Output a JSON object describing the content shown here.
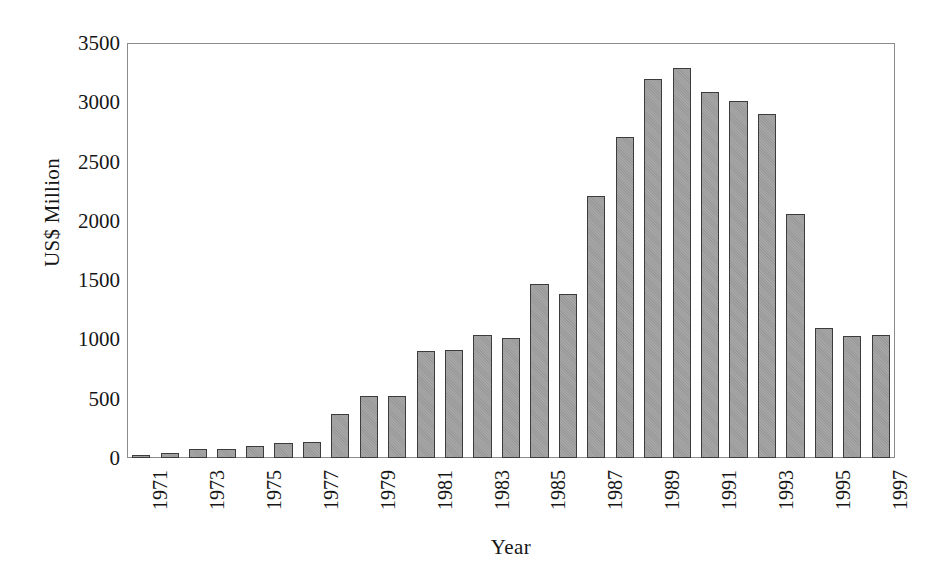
{
  "chart_data": {
    "type": "bar",
    "title": "",
    "xlabel": "Year",
    "ylabel": "US$ Million",
    "ylim": [
      0,
      3500
    ],
    "ytick_values": [
      0,
      500,
      1000,
      1500,
      2000,
      2500,
      3000,
      3500
    ],
    "ytick_labels": [
      "0",
      "500",
      "1000",
      "1500",
      "2000",
      "2500",
      "3000",
      "3500"
    ],
    "grid": false,
    "legend": null,
    "categories": [
      "1971",
      "1972",
      "1973",
      "1974",
      "1975",
      "1976",
      "1977",
      "1978",
      "1979",
      "1980",
      "1981",
      "1982",
      "1983",
      "1984",
      "1985",
      "1986",
      "1987",
      "1988",
      "1989",
      "1990",
      "1991",
      "1992",
      "1993",
      "1994",
      "1995",
      "1996",
      "1997"
    ],
    "xtick_labels_shown": [
      "1971",
      "1973",
      "1975",
      "1977",
      "1979",
      "1981",
      "1983",
      "1985",
      "1987",
      "1989",
      "1991",
      "1993",
      "1995",
      "1997"
    ],
    "values": [
      20,
      45,
      75,
      75,
      105,
      130,
      135,
      370,
      525,
      525,
      900,
      915,
      1040,
      1010,
      1470,
      1380,
      2210,
      2705,
      3200,
      3290,
      3090,
      3010,
      2900,
      2060,
      1100,
      1025,
      1040
    ],
    "bar_fill_color": "#a0a0a0",
    "bar_edge_color": "#3c3c3c",
    "axis_color": "#8b8b8b",
    "background_color": "#ffffff"
  }
}
